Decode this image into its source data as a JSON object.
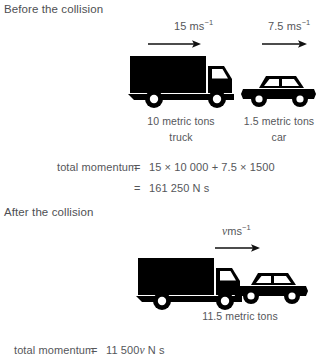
{
  "sections": {
    "before": {
      "heading": "Before the collision",
      "truck": {
        "velocity": "15 ms",
        "velocity_exponent": "−1",
        "mass_label": "10 metric tons",
        "name_label": "truck",
        "icon": "truck-icon",
        "arrow": "right-arrow-icon"
      },
      "car": {
        "velocity": "7.5 ms",
        "velocity_exponent": "−1",
        "mass_label": "1.5 metric tons",
        "name_label": "car",
        "icon": "car-icon",
        "arrow": "right-arrow-icon"
      },
      "equation": {
        "lhs": "total momentum",
        "eq_sign_1": "=",
        "rhs_1": "15 × 10 000 + 7.5 × 1500",
        "eq_sign_2": "=",
        "rhs_2": "161 250 N s"
      }
    },
    "after": {
      "heading": "After the collision",
      "combined": {
        "velocity_var": "v",
        "velocity_units": "ms",
        "velocity_exponent": "−1",
        "mass_label": "11.5 metric tons",
        "truck_icon": "truck-icon",
        "car_icon": "car-icon",
        "arrow": "right-arrow-icon"
      },
      "equation": {
        "lhs": "total momentum",
        "eq_sign": "=",
        "rhs_prefix": "11 500",
        "rhs_var": "v",
        "rhs_suffix": "N s"
      }
    }
  },
  "colors": {
    "text": "#55565a",
    "vehicle": "#000000",
    "background": "#ffffff"
  }
}
